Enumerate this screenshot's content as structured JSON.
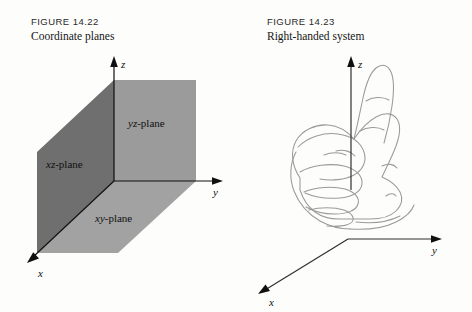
{
  "page": {
    "background_color": "#fdfdfc",
    "width": 472,
    "height": 312
  },
  "figures": [
    {
      "id": "figure-14-22",
      "caption_id": "FIGURE 14.22",
      "caption_title": "Coordinate planes",
      "diagram_type": "coordinate-planes-3d",
      "axes": [
        {
          "name": "x",
          "label": "x",
          "direction": "lower-left",
          "arrow": true
        },
        {
          "name": "y",
          "label": "y",
          "direction": "right",
          "arrow": true
        },
        {
          "name": "z",
          "label": "z",
          "direction": "up",
          "arrow": true
        }
      ],
      "planes": [
        {
          "name": "xz-plane",
          "label_prefix": "xz",
          "label_suffix": "-plane",
          "color": "#6f6f6f"
        },
        {
          "name": "yz-plane",
          "label_prefix": "yz",
          "label_suffix": "-plane",
          "color": "#9b9b9b"
        },
        {
          "name": "xy-plane",
          "label_prefix": "xy",
          "label_suffix": "-plane",
          "color": "#a2a2a2"
        }
      ],
      "axis_color": "#101010"
    },
    {
      "id": "figure-14-23",
      "caption_id": "FIGURE 14.23",
      "caption_title": "Right-handed system",
      "diagram_type": "right-hand-rule",
      "axes": [
        {
          "name": "x",
          "label": "x",
          "direction": "lower-left",
          "arrow": true
        },
        {
          "name": "y",
          "label": "y",
          "direction": "right",
          "arrow": true
        },
        {
          "name": "z",
          "label": "z",
          "direction": "up",
          "arrow": true
        }
      ],
      "hand": {
        "description": "right hand, fist with thumb pointing up along z-axis",
        "outline_color": "#9a9a9a",
        "fill_color": "#ffffff"
      },
      "axis_color": "#101010"
    }
  ]
}
